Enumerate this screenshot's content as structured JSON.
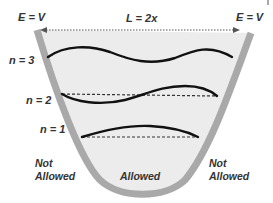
{
  "diagram": {
    "title_labels": {
      "left_boundary": "E = V",
      "width": "L = 2x",
      "right_boundary": "E = V"
    },
    "levels": [
      {
        "label": "n = 3",
        "n": 3
      },
      {
        "label": "n = 2",
        "n": 2
      },
      {
        "label": "n = 1",
        "n": 1
      }
    ],
    "regions": {
      "left": {
        "line1": "Not",
        "line2": "Allowed"
      },
      "center": "Allowed",
      "right": {
        "line1": "Not",
        "line2": "Allowed"
      }
    },
    "colors": {
      "wall": "#a9a9a9",
      "interior": "#ececec",
      "wave": "#111111",
      "dashed_baseline": "#333333",
      "text": "#333333"
    }
  }
}
